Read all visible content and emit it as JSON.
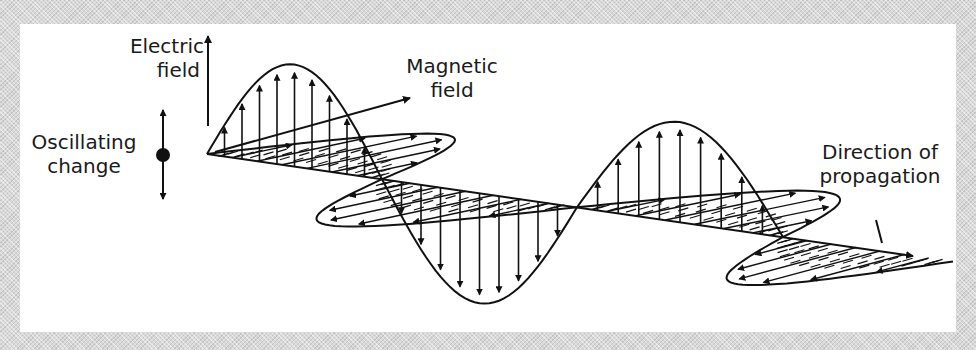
{
  "diagram": {
    "labels": {
      "electric_field": [
        "Electric",
        "field"
      ],
      "magnetic_field": [
        "Magnetic",
        "field"
      ],
      "oscillating_change": [
        "Oscillating",
        "change"
      ],
      "direction_of_propagation": [
        "Direction of",
        "propagation"
      ]
    },
    "colors": {
      "background": "#d9d9d9",
      "panel": "#ffffff",
      "ink": "#111111"
    },
    "geometry": {
      "axis_start": [
        207,
        154
      ],
      "axis_end": [
        915,
        256
      ],
      "nodes_x": [
        207,
        382,
        577,
        783
      ],
      "electric_amplitudes": [
        -102,
        110,
        -100,
        0
      ],
      "magnetic_offsets": [
        [
          150,
          -32
        ],
        [
          -150,
          32
        ],
        [
          145,
          -30
        ],
        [
          -130,
          35
        ]
      ],
      "electric_arrows_per_lobe": 9,
      "magnetic_arrows_per_lobe": 6
    }
  }
}
